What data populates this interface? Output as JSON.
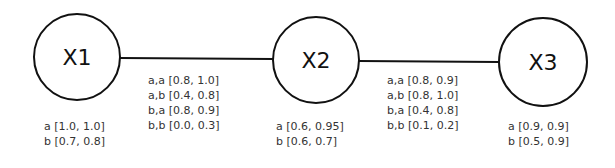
{
  "nodes": [
    {
      "id": "X1",
      "label": "X1",
      "cx": 77,
      "cy": 57,
      "r": 43,
      "table": [
        "a [1.0, 1.0]",
        "b [0.7, 0.8]"
      ]
    },
    {
      "id": "X2",
      "label": "X2",
      "cx": 316,
      "cy": 60,
      "r": 43,
      "table": [
        "a [0.6, 0.95]",
        "b [0.6, 0.7]"
      ]
    },
    {
      "id": "X3",
      "label": "X3",
      "cx": 543,
      "cy": 62,
      "r": 44,
      "table": [
        "a [0.9, 0.9]",
        "b [0.5, 0.9]"
      ]
    }
  ],
  "edges": [
    {
      "from": "X1",
      "to": "X2",
      "table": [
        "a,a [0.8, 1.0]",
        "a,b [0.4, 0.8]",
        "b,a [0.8, 0.9]",
        "b,b [0.0, 0.3]"
      ]
    },
    {
      "from": "X2",
      "to": "X3",
      "table": [
        "a,a [0.8, 0.9]",
        "a,b [0.8, 1.0]",
        "b,a [0.4, 0.8]",
        "b,b [0.1, 0.2]"
      ]
    }
  ],
  "colors": {
    "stroke": "#111111",
    "text": "#333333",
    "background": "#ffffff"
  }
}
